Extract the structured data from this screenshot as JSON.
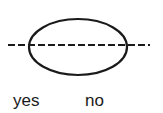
{
  "diagram": {
    "shapes": [
      {
        "type": "ellipse",
        "cx": 78,
        "cy": 47,
        "rx": 49,
        "ry": 28,
        "stroke": "#1a1a1a",
        "stroke_width": 2.2
      },
      {
        "type": "dashed-line",
        "x1": 8,
        "y1": 45,
        "x2": 150,
        "y2": 45,
        "stroke": "#1a1a1a",
        "dash": "7 3"
      }
    ],
    "labels": {
      "yes": "yes",
      "no": "no"
    }
  }
}
